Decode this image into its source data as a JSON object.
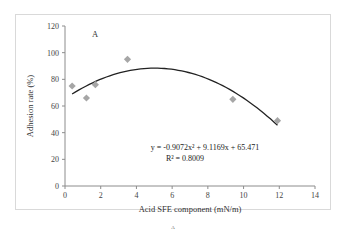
{
  "chart_data": {
    "type": "scatter",
    "title": "",
    "panel_label": "A",
    "caption": "A",
    "xlabel": "Acid SFE component (mN/m)",
    "ylabel": "Adhesion rate (%)",
    "xlim": [
      0,
      14
    ],
    "ylim": [
      0,
      120
    ],
    "xticks": [
      0,
      2,
      4,
      6,
      8,
      10,
      12,
      14
    ],
    "yticks": [
      0,
      20,
      40,
      60,
      80,
      100,
      120
    ],
    "grid": false,
    "series": [
      {
        "name": "Adhesion rate",
        "marker": "diamond",
        "color": "#a6a6a6",
        "x": [
          0.4,
          1.2,
          1.7,
          3.5,
          9.4,
          11.9
        ],
        "y": [
          75,
          66,
          76,
          95,
          65,
          49
        ]
      }
    ],
    "trendline": {
      "type": "polynomial",
      "order": 2,
      "coefficients": [
        -0.9072,
        9.1169,
        65.471
      ],
      "x_range": [
        0.4,
        11.9
      ],
      "equation": "y = -0.9072x² + 9.1169x + 65.471",
      "r_squared": "R² = 0.8009",
      "color": "#222222"
    }
  }
}
